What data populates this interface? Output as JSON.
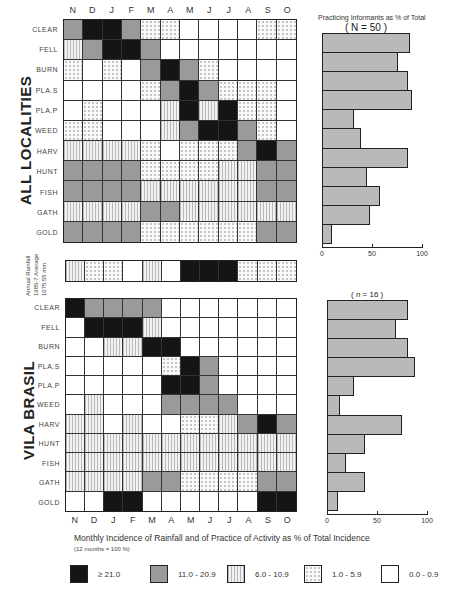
{
  "months": [
    "N",
    "D",
    "J",
    "F",
    "M",
    "A",
    "M",
    "J",
    "J",
    "A",
    "S",
    "O"
  ],
  "activities": [
    "CLEAR",
    "FELL",
    "BURN",
    "PLA.S",
    "PLA.P",
    "WEED",
    "HARV",
    "HUNT",
    "FISH",
    "GATH",
    "GOLD"
  ],
  "sections": {
    "all": {
      "label": "ALL LOCALITIES",
      "n_label": "( N = 50 )"
    },
    "vila": {
      "label": "VILA BRASIL",
      "n_label": "( n = 16 )"
    }
  },
  "bar_header": "Practicing Informants as % of Total",
  "bar_axis": {
    "ticks": [
      "0",
      "50",
      "100"
    ]
  },
  "rainfall": {
    "label_line1": "Annual Rainfall",
    "label_line2": "1985-7 Average",
    "label_line3": "1075.55 mm"
  },
  "caption": {
    "line1": "Monthly Incidence of Rainfall and of Practice of Activity as % of Total Incidence",
    "line2": "(12 months = 100 %)"
  },
  "legend": [
    {
      "code": "B",
      "label": "≥ 21.0"
    },
    {
      "code": "G",
      "label": "11.0 - 20.9"
    },
    {
      "code": "V",
      "label": "6.0 - 10.9"
    },
    {
      "code": "D",
      "label": "1.0 - 5.9"
    },
    {
      "code": "W",
      "label": "0.0 - 0.9"
    }
  ],
  "chart_data": [
    {
      "type": "heatmap",
      "title": "ALL LOCALITIES",
      "xlabel": "Month",
      "ylabel": "Activity",
      "categories_x": [
        "N",
        "D",
        "J",
        "F",
        "M",
        "A",
        "M",
        "J",
        "J",
        "A",
        "S",
        "O"
      ],
      "categories_y": [
        "CLEAR",
        "FELL",
        "BURN",
        "PLA.S",
        "PLA.P",
        "WEED",
        "HARV",
        "HUNT",
        "FISH",
        "GATH",
        "GOLD"
      ],
      "legend_classes": {
        "B": ">=21.0",
        "G": "11.0-20.9",
        "V": "6.0-10.9",
        "D": "1.0-5.9",
        "W": "0.0-0.9"
      },
      "values": [
        [
          "G",
          "B",
          "B",
          "G",
          "D",
          "D",
          "W",
          "W",
          "W",
          "W",
          "D",
          "D"
        ],
        [
          "V",
          "G",
          "B",
          "B",
          "G",
          "W",
          "W",
          "W",
          "W",
          "W",
          "W",
          "W"
        ],
        [
          "D",
          "W",
          "D",
          "W",
          "G",
          "B",
          "G",
          "D",
          "W",
          "W",
          "W",
          "W"
        ],
        [
          "W",
          "W",
          "W",
          "W",
          "D",
          "G",
          "B",
          "G",
          "D",
          "D",
          "D",
          "W"
        ],
        [
          "W",
          "D",
          "W",
          "W",
          "W",
          "V",
          "B",
          "V",
          "B",
          "D",
          "D",
          "W"
        ],
        [
          "D",
          "D",
          "W",
          "W",
          "W",
          "V",
          "G",
          "B",
          "B",
          "G",
          "D",
          "W"
        ],
        [
          "V",
          "V",
          "V",
          "V",
          "D",
          "W",
          "D",
          "D",
          "D",
          "G",
          "B",
          "G"
        ],
        [
          "G",
          "G",
          "G",
          "G",
          "D",
          "D",
          "D",
          "D",
          "V",
          "V",
          "G",
          "G"
        ],
        [
          "G",
          "G",
          "G",
          "G",
          "V",
          "V",
          "V",
          "V",
          "V",
          "V",
          "G",
          "G"
        ],
        [
          "V",
          "V",
          "V",
          "V",
          "G",
          "G",
          "V",
          "V",
          "V",
          "V",
          "V",
          "V"
        ],
        [
          "G",
          "G",
          "G",
          "G",
          "D",
          "D",
          "D",
          "D",
          "D",
          "D",
          "G",
          "G"
        ]
      ]
    },
    {
      "type": "heatmap",
      "title": "Annual Rainfall 1985-7 Average 1075.55 mm",
      "categories_x": [
        "N",
        "D",
        "J",
        "F",
        "M",
        "A",
        "M",
        "J",
        "J",
        "A",
        "S",
        "O"
      ],
      "values": [
        [
          "V",
          "D",
          "D",
          "W",
          "V",
          "W",
          "B",
          "B",
          "B",
          "D",
          "D",
          "D"
        ]
      ]
    },
    {
      "type": "heatmap",
      "title": "VILA BRASIL",
      "categories_x": [
        "N",
        "D",
        "J",
        "F",
        "M",
        "A",
        "M",
        "J",
        "J",
        "A",
        "S",
        "O"
      ],
      "categories_y": [
        "CLEAR",
        "FELL",
        "BURN",
        "PLA.S",
        "PLA.P",
        "WEED",
        "HARV",
        "HUNT",
        "FISH",
        "GATH",
        "GOLD"
      ],
      "values": [
        [
          "B",
          "G",
          "G",
          "G",
          "G",
          "W",
          "W",
          "W",
          "W",
          "W",
          "W",
          "W"
        ],
        [
          "W",
          "B",
          "B",
          "B",
          "V",
          "W",
          "W",
          "W",
          "W",
          "W",
          "W",
          "W"
        ],
        [
          "W",
          "W",
          "V",
          "V",
          "B",
          "B",
          "W",
          "W",
          "W",
          "W",
          "W",
          "W"
        ],
        [
          "W",
          "W",
          "W",
          "W",
          "W",
          "D",
          "B",
          "G",
          "W",
          "W",
          "W",
          "W"
        ],
        [
          "W",
          "W",
          "W",
          "W",
          "W",
          "B",
          "B",
          "G",
          "W",
          "W",
          "W",
          "W"
        ],
        [
          "W",
          "V",
          "W",
          "W",
          "W",
          "G",
          "G",
          "G",
          "G",
          "W",
          "W",
          "W"
        ],
        [
          "V",
          "V",
          "W",
          "V",
          "W",
          "W",
          "D",
          "D",
          "V",
          "G",
          "B",
          "G"
        ],
        [
          "V",
          "V",
          "V",
          "V",
          "V",
          "V",
          "V",
          "V",
          "V",
          "V",
          "V",
          "V"
        ],
        [
          "V",
          "V",
          "V",
          "V",
          "V",
          "V",
          "V",
          "V",
          "V",
          "V",
          "V",
          "V"
        ],
        [
          "V",
          "V",
          "V",
          "V",
          "G",
          "G",
          "D",
          "D",
          "D",
          "D",
          "G",
          "G"
        ],
        [
          "W",
          "W",
          "B",
          "B",
          "W",
          "W",
          "W",
          "W",
          "W",
          "W",
          "B",
          "B"
        ]
      ]
    },
    {
      "type": "bar",
      "orientation": "horizontal",
      "title": "Practicing Informants as % of Total (N = 50)",
      "categories": [
        "CLEAR",
        "FELL",
        "BURN",
        "PLA.S",
        "PLA.P",
        "WEED",
        "HARV",
        "HUNT",
        "FISH",
        "GATH",
        "GOLD"
      ],
      "values": [
        88,
        76,
        86,
        90,
        32,
        39,
        86,
        45,
        58,
        48,
        10
      ],
      "xlim": [
        0,
        100
      ]
    },
    {
      "type": "bar",
      "orientation": "horizontal",
      "title": "Practicing Informants as % of Total (n = 16)",
      "categories": [
        "CLEAR",
        "FELL",
        "BURN",
        "PLA.S",
        "PLA.P",
        "WEED",
        "HARV",
        "HUNT",
        "FISH",
        "GATH",
        "GOLD"
      ],
      "values": [
        81,
        69,
        81,
        88,
        27,
        13,
        75,
        38,
        19,
        38,
        11
      ],
      "xlim": [
        0,
        100
      ]
    }
  ]
}
